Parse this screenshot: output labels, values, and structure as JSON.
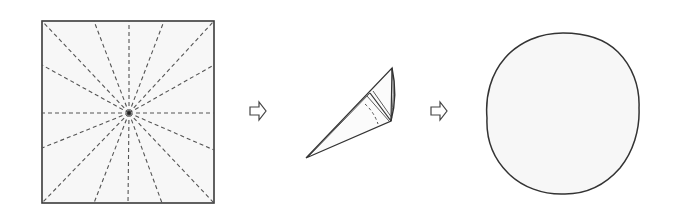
{
  "diagram": {
    "kind": "paper-folding sequence",
    "steps": [
      {
        "id": "step-1",
        "label": "Square sheet with radial dashed fold lines",
        "square": {
          "x": 42,
          "y": 21,
          "w": 172,
          "h": 182
        },
        "center": [
          129,
          113
        ],
        "fold_line_endpoints": [
          [
            42,
            21
          ],
          [
            94,
            21
          ],
          [
            129,
            21
          ],
          [
            164,
            21
          ],
          [
            214,
            21
          ],
          [
            214,
            65
          ],
          [
            214,
            113
          ],
          [
            214,
            150
          ],
          [
            214,
            203
          ],
          [
            162,
            203
          ],
          [
            128,
            203
          ],
          [
            94,
            203
          ],
          [
            42,
            203
          ],
          [
            42,
            148
          ],
          [
            42,
            113
          ],
          [
            42,
            65
          ]
        ]
      },
      {
        "id": "step-2",
        "label": "Sheet rolled into a cone"
      },
      {
        "id": "step-3",
        "label": "Resulting circular shape (cone viewed from above)",
        "circle": {
          "cx": 563,
          "cy": 113,
          "rx": 76,
          "ry": 81
        }
      }
    ],
    "arrows": [
      {
        "id": "arrow-1",
        "x": 250,
        "y": 102,
        "label": "then"
      },
      {
        "id": "arrow-2",
        "x": 431,
        "y": 102,
        "label": "then"
      }
    ],
    "colors": {
      "stroke": "#3a3a3a",
      "dash": "#555555",
      "fill": "#f7f7f7",
      "background": "#ffffff"
    }
  }
}
